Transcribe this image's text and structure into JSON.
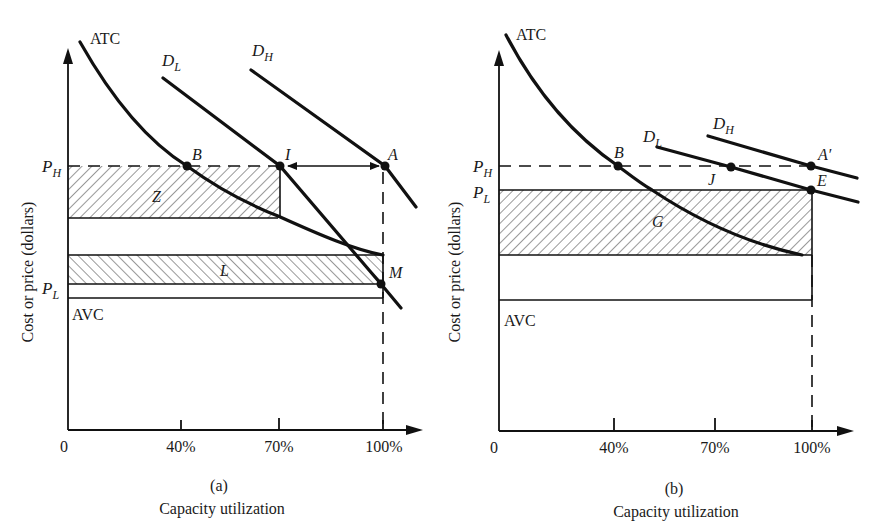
{
  "figure": {
    "panels": [
      {
        "id": "a",
        "caption": "(a)",
        "xlabel": "Capacity utilization",
        "ylabel": "Cost or price (dollars)",
        "origin_label": "0",
        "x_ticks": [
          "40%",
          "70%",
          "100%"
        ],
        "price_labels": {
          "high": "P",
          "high_sub": "H",
          "low": "P",
          "low_sub": "L"
        },
        "curve_labels": {
          "atc": "ATC",
          "avc": "AVC",
          "dl": "D",
          "dl_sub": "L",
          "dh": "D",
          "dh_sub": "H"
        },
        "point_labels": {
          "b": "B",
          "i": "I",
          "a": "A",
          "m": "M"
        },
        "area_labels": {
          "z": "Z",
          "l": "L"
        }
      },
      {
        "id": "b",
        "caption": "(b)",
        "xlabel": "Capacity utilization",
        "ylabel": "Cost or price (dollars)",
        "origin_label": "0",
        "x_ticks": [
          "40%",
          "70%",
          "100%"
        ],
        "price_labels": {
          "high": "P",
          "high_sub": "H",
          "low": "P",
          "low_sub": "L"
        },
        "curve_labels": {
          "atc": "ATC",
          "avc": "AVC",
          "dl": "D",
          "dl_sub": "L",
          "dh": "D",
          "dh_sub": "H"
        },
        "point_labels": {
          "b": "B",
          "j": "J",
          "a": "A′",
          "e": "E"
        },
        "area_labels": {
          "g": "G"
        }
      }
    ]
  }
}
